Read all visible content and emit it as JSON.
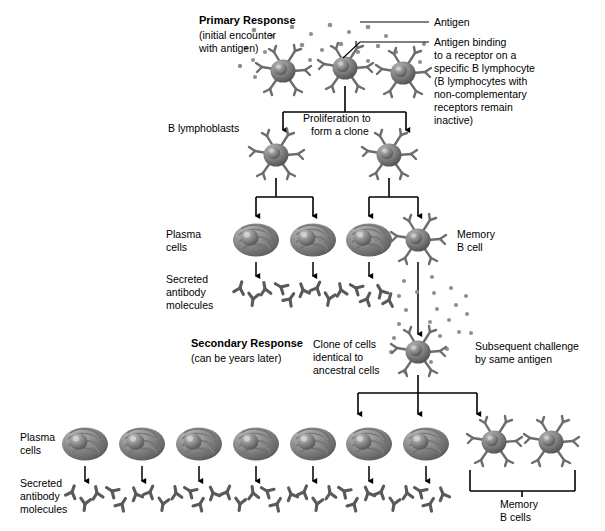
{
  "figure": {
    "type": "biology-flow-diagram"
  },
  "labels": {
    "primary_response_title": "Primary Response",
    "primary_response_sub_line1": "(initial encounter",
    "primary_response_sub_line2": "with antigen)",
    "antigen": "Antigen",
    "antigen_binding_l1": "Antigen binding",
    "antigen_binding_l2": "to a receptor on a",
    "antigen_binding_l3": "specific B lymphocyte",
    "antigen_binding_l4": "(B lymphocytes with",
    "antigen_binding_l5": "non-complementary",
    "antigen_binding_l6": "receptors remain",
    "antigen_binding_l7": "inactive)",
    "b_lymphoblasts": "B lymphoblasts",
    "proliferation_l1": "Proliferation to",
    "proliferation_l2": "form a clone",
    "plasma_cells_l1": "Plasma",
    "plasma_cells_l2": "cells",
    "secreted_l1": "Secreted",
    "secreted_l2": "antibody",
    "secreted_l3": "molecules",
    "memory_b_cell_l1": "Memory",
    "memory_b_cell_l2": "B cell",
    "secondary_response_title": "Secondary Response",
    "secondary_response_sub": "(can be years later)",
    "clone_of_cells_l1": "Clone of cells",
    "clone_of_cells_l2": "identical to",
    "clone_of_cells_l3": "ancestral cells",
    "subsequent_challenge_l1": "Subsequent challenge",
    "subsequent_challenge_l2": "by same antigen",
    "plasma_cells2_l1": "Plasma",
    "plasma_cells2_l2": "cells",
    "secreted2_l1": "Secreted",
    "secreted2_l2": "antibody",
    "secreted2_l3": "molecules",
    "memory_b_cells_l1": "Memory",
    "memory_b_cells_l2": "B cells"
  },
  "colors": {
    "line": "#000000",
    "cell_dark": "#4a4a4a",
    "cell_mid": "#7d7d7d",
    "cell_light": "#b8b8b8",
    "antigen_dot": "#8c8c8c",
    "antibody": "#595959",
    "background": "#ffffff"
  },
  "counts": {
    "top_b_lymphocytes": 3,
    "b_lymphoblasts": 2,
    "primary_plasma_cells": 3,
    "primary_memory_b_cells": 1,
    "secondary_plasma_cells": 7,
    "secondary_memory_b_cells": 2
  },
  "cells": {
    "top_lymphocytes": [
      {
        "cx": 283,
        "cy": 71
      },
      {
        "cx": 345,
        "cy": 68
      },
      {
        "cx": 403,
        "cy": 73
      }
    ],
    "lymphoblasts": [
      {
        "cx": 276,
        "cy": 155
      },
      {
        "cx": 389,
        "cy": 155
      }
    ],
    "primary_plasma": [
      {
        "cx": 256,
        "cy": 240
      },
      {
        "cx": 313,
        "cy": 240
      },
      {
        "cx": 369,
        "cy": 240
      }
    ],
    "primary_memory": [
      {
        "cx": 418,
        "cy": 240
      }
    ],
    "secondary_trigger_memory": [
      {
        "cx": 418,
        "cy": 352
      }
    ],
    "secondary_plasma": [
      {
        "cx": 85,
        "cy": 444
      },
      {
        "cx": 142,
        "cy": 444
      },
      {
        "cx": 199,
        "cy": 444
      },
      {
        "cx": 256,
        "cy": 444
      },
      {
        "cx": 313,
        "cy": 444
      },
      {
        "cx": 369,
        "cy": 444
      },
      {
        "cx": 426,
        "cy": 444
      }
    ],
    "secondary_memory": [
      {
        "cx": 494,
        "cy": 442
      },
      {
        "cx": 551,
        "cy": 442
      }
    ]
  }
}
